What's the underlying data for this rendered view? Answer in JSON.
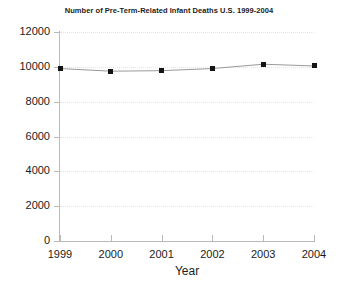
{
  "chart_data": {
    "type": "line",
    "title": "Number of Pre-Term-Related Infant Deaths U.S. 1999-2004",
    "xlabel": "Year",
    "ylabel": "",
    "categories": [
      "1999",
      "2000",
      "2001",
      "2002",
      "2003",
      "2004"
    ],
    "values": [
      9900,
      9750,
      9780,
      9900,
      10150,
      10050
    ],
    "series": [
      {
        "name": "Pre-Term-Related Infant Deaths",
        "values": [
          9900,
          9750,
          9780,
          9900,
          10150,
          10050
        ]
      }
    ],
    "ylim": [
      0,
      12000
    ],
    "yticks": [
      0,
      2000,
      4000,
      6000,
      8000,
      10000,
      12000
    ],
    "ytick_labels": [
      "0",
      "2000",
      "4000",
      "6000",
      "8000",
      "10000",
      "12000"
    ],
    "xtick_labels": [
      "1999",
      "2000",
      "2001",
      "2002",
      "2003",
      "2004"
    ],
    "grid": true,
    "grid_style": "dotted-horizontal",
    "legend": "none",
    "marker": "square",
    "marker_color": "#141414",
    "line_color": "#9a9a9a",
    "axis_color": "#b9b9b9",
    "background": "#ffffff"
  }
}
